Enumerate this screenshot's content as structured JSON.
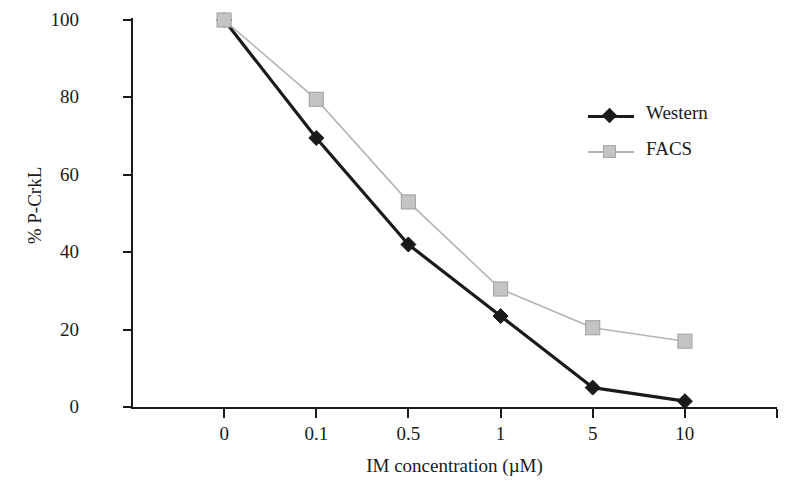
{
  "chart_data": {
    "type": "line",
    "title": "",
    "xlabel": "IM concentration (µM)",
    "ylabel": "% P-CrkL",
    "categories": [
      "0",
      "0.1",
      "0.5",
      "1",
      "5",
      "10"
    ],
    "ylim": [
      0,
      100
    ],
    "yticks": [
      0,
      20,
      40,
      60,
      80,
      100
    ],
    "ytick_labels": [
      "0",
      "20",
      "40",
      "60",
      "80",
      "100"
    ],
    "grid": false,
    "legend_position": "upper right",
    "series": [
      {
        "name": "Western",
        "color": "#1a1a1a",
        "marker": "diamond",
        "values": [
          100,
          69.5,
          42,
          23.5,
          5,
          1.5
        ]
      },
      {
        "name": "FACS",
        "color": "#b3b3b3",
        "marker": "square",
        "values": [
          100,
          79.5,
          53,
          30.5,
          20.5,
          17
        ]
      }
    ]
  },
  "axes": {
    "y_title": "% P-CrkL",
    "x_title": "IM concentration (µM)"
  },
  "legend": {
    "items": [
      {
        "label": "Western"
      },
      {
        "label": "FACS"
      }
    ]
  },
  "colors": {
    "western": "#1a1a1a",
    "facs": "#b3b3b3",
    "facs_marker_fill": "#c4c4c4",
    "facs_marker_stroke": "#a8a8a8",
    "axis": "#1a1a1a",
    "background": "#ffffff"
  }
}
